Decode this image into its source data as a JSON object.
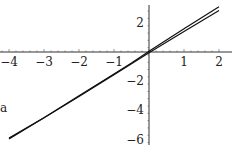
{
  "chart_data": {
    "type": "line",
    "title": "",
    "xlabel": "",
    "ylabel": "",
    "xlim": [
      -4.2,
      2.2
    ],
    "ylim": [
      -6.3,
      3.3
    ],
    "grid": false,
    "legend": null,
    "x_ticks": [
      -4,
      -3,
      -2,
      -1,
      1,
      2
    ],
    "y_ticks": [
      2,
      -2,
      -4,
      -6
    ],
    "series": [
      {
        "name": "curve-upper",
        "x": [
          -4,
          -3,
          -2,
          -1,
          -0.5,
          0,
          1,
          2
        ],
        "y": [
          -5.9,
          -4.5,
          -3.0,
          -1.5,
          -0.75,
          0.05,
          1.6,
          3.1
        ]
      },
      {
        "name": "curve-lower",
        "x": [
          -4,
          -3,
          -2,
          -1,
          -0.5,
          0,
          1,
          2
        ],
        "y": [
          -5.95,
          -4.5,
          -3.05,
          -1.55,
          -0.8,
          -0.05,
          1.4,
          2.85
        ]
      }
    ],
    "x_tick_labels": [
      "-4",
      "-3",
      "-2",
      "-1",
      "1",
      "2"
    ],
    "y_tick_labels": [
      "2",
      "-2",
      "-4",
      "-6"
    ]
  }
}
